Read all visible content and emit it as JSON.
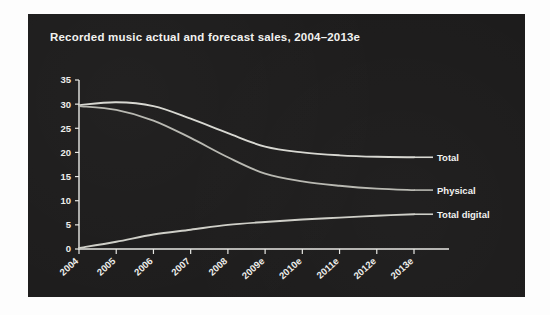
{
  "page": {
    "background_color": "#fdfdfd",
    "panel_color": "#1d1c1c"
  },
  "chart_data": {
    "type": "line",
    "title": "Recorded music actual and forecast sales, 2004–2013e",
    "xlabel": "",
    "ylabel": "",
    "categories": [
      "2004",
      "2005",
      "2006",
      "2007",
      "2008",
      "2009e",
      "2010e",
      "2011e",
      "2012e",
      "2013e"
    ],
    "ylim": [
      0,
      35
    ],
    "yticks": [
      0,
      5,
      10,
      15,
      20,
      25,
      30,
      35
    ],
    "grid": false,
    "legend_position": "right-inline-labels",
    "series": [
      {
        "name": "Total",
        "color": "#d8d8d2",
        "values": [
          29.8,
          30.4,
          29.6,
          27.0,
          24.0,
          21.2,
          20.0,
          19.4,
          19.1,
          19.0
        ]
      },
      {
        "name": "Physical",
        "color": "#b9b9b2",
        "values": [
          29.6,
          28.8,
          26.6,
          23.0,
          19.0,
          15.6,
          14.0,
          13.1,
          12.5,
          12.2
        ]
      },
      {
        "name": "Total digital",
        "color": "#cfcfc8",
        "values": [
          0.2,
          1.5,
          3.0,
          4.0,
          5.0,
          5.6,
          6.1,
          6.5,
          6.9,
          7.2
        ]
      }
    ],
    "annotations": [
      {
        "text": "Total",
        "series": "Total"
      },
      {
        "text": "Physical",
        "series": "Physical"
      },
      {
        "text": "Total digital",
        "series": "Total digital"
      }
    ]
  }
}
